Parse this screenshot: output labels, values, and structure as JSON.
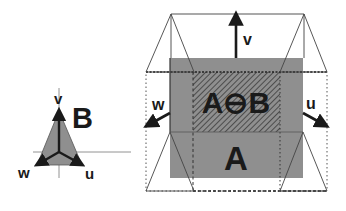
{
  "figure": {
    "left_panel": {
      "shape_label": "B",
      "axes": {
        "v": "v",
        "u": "u",
        "w": "w"
      }
    },
    "right_panel": {
      "set_label": "A",
      "erosion_label": "A⊖B",
      "axes": {
        "v": "v",
        "u": "u",
        "w": "w"
      }
    },
    "colors": {
      "gray_fill": "#8f8f8f",
      "hatch_line": "#3a3a3a",
      "stroke": "#333333",
      "text": "#1a1a1a"
    }
  }
}
